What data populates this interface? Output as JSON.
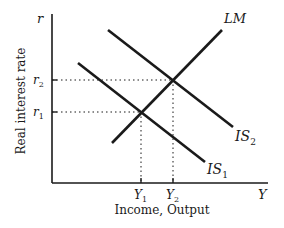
{
  "diagram": {
    "type": "IS-LM model",
    "axes": {
      "y_symbol": "r",
      "x_symbol": "Y",
      "y_label": "Real interest rate",
      "x_label": "Income, Output"
    },
    "curves": {
      "lm": {
        "label": "LM"
      },
      "is1": {
        "label": "IS",
        "sub": "1"
      },
      "is2": {
        "label": "IS",
        "sub": "2"
      }
    },
    "ticks": {
      "r1": {
        "label": "r",
        "sub": "1"
      },
      "r2": {
        "label": "r",
        "sub": "2"
      },
      "y1": {
        "label": "Y",
        "sub": "1"
      },
      "y2": {
        "label": "Y",
        "sub": "2"
      }
    },
    "colors": {
      "line": "#1a1a1a",
      "background": "#ffffff"
    }
  }
}
